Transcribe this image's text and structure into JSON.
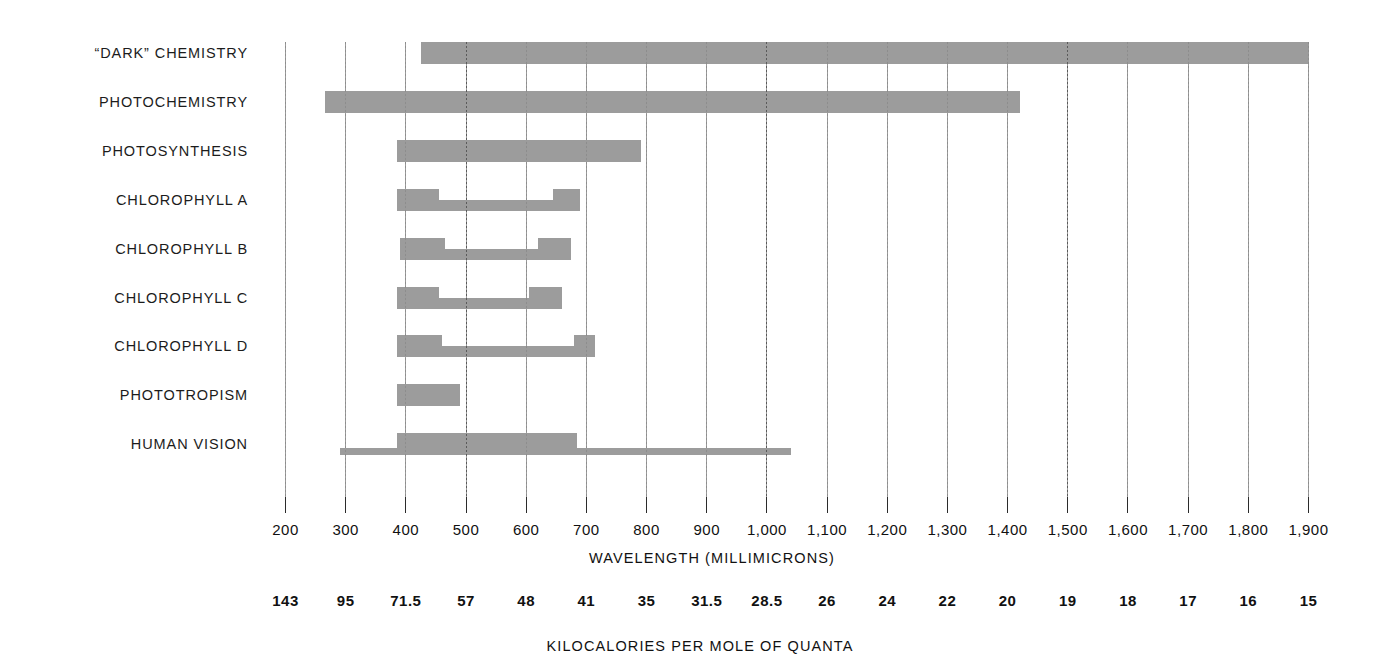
{
  "chart_data": {
    "type": "bar",
    "title": "",
    "subtitle": "",
    "xlabel": "WAVELENGTH  (MILLIMICRONS)",
    "xlabel_secondary": "KILOCALORIES PER MOLE OF QUANTA",
    "ylabel": "",
    "orientation": "horizontal",
    "grid": true,
    "legend": "none",
    "xlim": [
      200,
      1900
    ],
    "x_unit": "millimicrons (nm)",
    "x_ticks": [
      200,
      300,
      400,
      500,
      600,
      700,
      800,
      900,
      1000,
      1100,
      1200,
      1300,
      1400,
      1500,
      1600,
      1700,
      1800,
      1900
    ],
    "x_tick_labels": [
      "200",
      "300",
      "400",
      "500",
      "600",
      "700",
      "800",
      "900",
      "1,000",
      "1,100",
      "1,200",
      "1,300",
      "1,400",
      "1,500",
      "1,600",
      "1,700",
      "1,800",
      "1,900"
    ],
    "secondary_axis_tick_labels": [
      "143",
      "95",
      "71.5",
      "57",
      "48",
      "41",
      "35",
      "31.5",
      "28.5",
      "26",
      "24",
      "22",
      "20",
      "19",
      "18",
      "17",
      "16",
      "15"
    ],
    "secondary_axis_unit": "kilocalories per mole of quanta",
    "bar_color": "#9c9c9c",
    "categories": [
      "“DARK”  CHEMISTRY",
      "PHOTOCHEMISTRY",
      "PHOTOSYNTHESIS",
      "CHLOROPHYLL  A",
      "CHLOROPHYLL  B",
      "CHLOROPHYLL  C",
      "CHLOROPHYLL  D",
      "PHOTOTROPISM",
      "HUMAN  VISION"
    ],
    "series": [
      {
        "name": "“DARK”  CHEMISTRY",
        "ranges": [
          {
            "start": 425,
            "end": 1900,
            "weight": "full"
          }
        ]
      },
      {
        "name": "PHOTOCHEMISTRY",
        "ranges": [
          {
            "start": 265,
            "end": 1420,
            "weight": "full"
          }
        ]
      },
      {
        "name": "PHOTOSYNTHESIS",
        "ranges": [
          {
            "start": 385,
            "end": 790,
            "weight": "full"
          }
        ]
      },
      {
        "name": "CHLOROPHYLL  A",
        "ranges": [
          {
            "start": 385,
            "end": 455,
            "weight": "full"
          },
          {
            "start": 455,
            "end": 645,
            "weight": "half"
          },
          {
            "start": 645,
            "end": 690,
            "weight": "full"
          }
        ]
      },
      {
        "name": "CHLOROPHYLL  B",
        "ranges": [
          {
            "start": 390,
            "end": 465,
            "weight": "full"
          },
          {
            "start": 465,
            "end": 620,
            "weight": "half"
          },
          {
            "start": 620,
            "end": 675,
            "weight": "full"
          }
        ]
      },
      {
        "name": "CHLOROPHYLL  C",
        "ranges": [
          {
            "start": 385,
            "end": 455,
            "weight": "full"
          },
          {
            "start": 455,
            "end": 605,
            "weight": "half"
          },
          {
            "start": 605,
            "end": 660,
            "weight": "full"
          }
        ]
      },
      {
        "name": "CHLOROPHYLL  D",
        "ranges": [
          {
            "start": 385,
            "end": 460,
            "weight": "full"
          },
          {
            "start": 460,
            "end": 680,
            "weight": "half"
          },
          {
            "start": 680,
            "end": 715,
            "weight": "full"
          }
        ]
      },
      {
        "name": "PHOTOTROPISM",
        "ranges": [
          {
            "start": 385,
            "end": 490,
            "weight": "full"
          }
        ]
      },
      {
        "name": "HUMAN  VISION",
        "ranges": [
          {
            "start": 290,
            "end": 385,
            "weight": "thin"
          },
          {
            "start": 385,
            "end": 685,
            "weight": "full"
          },
          {
            "start": 685,
            "end": 1040,
            "weight": "thin"
          }
        ]
      }
    ]
  }
}
